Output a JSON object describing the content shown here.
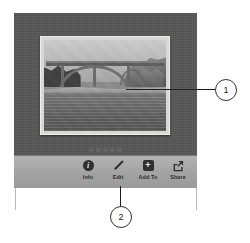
{
  "app": {
    "name": "photo-viewer",
    "background_color": "#ffffff"
  },
  "viewer": {
    "panel_color": "#565656",
    "photo": {
      "alt": "Grayscale photograph of a concrete arch bridge spanning a river with rocky cliffs on the right",
      "mat_color": "#d8d8d6"
    },
    "rating": {
      "max": 5,
      "value": 0,
      "stars": [
        "☆",
        "☆",
        "☆",
        "☆",
        "☆"
      ]
    }
  },
  "toolbar": {
    "background_color": "#a2a2a2",
    "items": [
      {
        "label": "Info",
        "icon": "info-icon",
        "glyph": "i"
      },
      {
        "label": "Edit",
        "icon": "pencil-icon",
        "glyph": ""
      },
      {
        "label": "Add To",
        "icon": "plus-box-icon",
        "glyph": "+"
      },
      {
        "label": "Share",
        "icon": "share-icon",
        "glyph": ""
      }
    ]
  },
  "callouts": [
    {
      "number": "1",
      "target": "photo"
    },
    {
      "number": "2",
      "target": "edit-button"
    }
  ]
}
